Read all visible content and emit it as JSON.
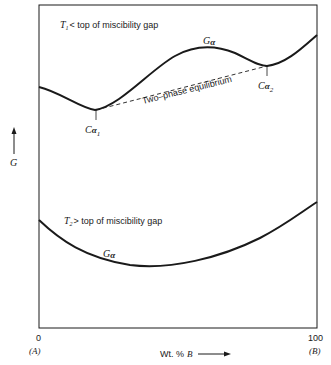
{
  "diagram": {
    "type": "free-energy-composition",
    "y_axis": {
      "label": "G",
      "arrow": "up"
    },
    "x_axis": {
      "label_prefix": "Wt. %",
      "label_var": "B",
      "left_tick": "0",
      "right_tick": "100",
      "left_end": "(A)",
      "right_end": "(B)"
    },
    "upper_panel": {
      "condition_var": "T",
      "condition_sub": "1",
      "condition_text": "< top of miscibility gap",
      "curve_label_main": "G",
      "curve_label_sub": "α",
      "tangent_label": "Two–phase equilibrium",
      "point1_main": "C",
      "point1_greek": "α",
      "point1_sub": "1",
      "point2_main": "C",
      "point2_greek": "α",
      "point2_sub": "2"
    },
    "lower_panel": {
      "condition_var": "T",
      "condition_sub": "2",
      "condition_text": "> top of miscibility gap",
      "curve_label_main": "G",
      "curve_label_sub": "α"
    },
    "colors": {
      "line": "#1a1a1a",
      "background": "#ffffff"
    }
  }
}
